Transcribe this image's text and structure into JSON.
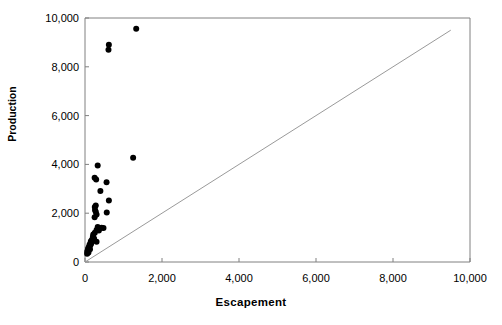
{
  "chart_data": {
    "type": "scatter",
    "title": "",
    "xlabel": "Escapement",
    "ylabel": "Production",
    "xlim": [
      0,
      10000
    ],
    "ylim": [
      0,
      10000
    ],
    "xticks": [
      0,
      2000,
      4000,
      6000,
      8000,
      10000
    ],
    "yticks": [
      0,
      2000,
      4000,
      6000,
      8000,
      10000
    ],
    "xtick_labels": [
      "0",
      "2,000",
      "4,000",
      "6,000",
      "8,000",
      "10,000"
    ],
    "ytick_labels": [
      "0",
      "2,000",
      "4,000",
      "6,000",
      "8,000",
      "10,000"
    ],
    "grid": false,
    "legend": false,
    "marker_color": "#000000",
    "marker_size": 6,
    "axis_color": "#808080",
    "reference_line": {
      "name": "replacement-line",
      "from": [
        0,
        0
      ],
      "to": [
        9500,
        9500
      ],
      "color": "#9a9a9a"
    },
    "series": [
      {
        "name": "Escapement vs Production",
        "points": [
          [
            1330,
            9560
          ],
          [
            620,
            8900
          ],
          [
            610,
            8700
          ],
          [
            330,
            3960
          ],
          [
            1250,
            4270
          ],
          [
            250,
            3450
          ],
          [
            290,
            3380
          ],
          [
            560,
            3270
          ],
          [
            400,
            2910
          ],
          [
            620,
            2520
          ],
          [
            280,
            2320
          ],
          [
            255,
            2250
          ],
          [
            260,
            2130
          ],
          [
            280,
            2060
          ],
          [
            565,
            2030
          ],
          [
            300,
            1950
          ],
          [
            250,
            1830
          ],
          [
            330,
            1430
          ],
          [
            430,
            1400
          ],
          [
            480,
            1390
          ],
          [
            300,
            1310
          ],
          [
            360,
            1290
          ],
          [
            255,
            1200
          ],
          [
            215,
            1130
          ],
          [
            205,
            1030
          ],
          [
            235,
            960
          ],
          [
            175,
            900
          ],
          [
            150,
            840
          ],
          [
            300,
            830
          ],
          [
            160,
            760
          ],
          [
            120,
            720
          ],
          [
            140,
            690
          ],
          [
            110,
            640
          ],
          [
            95,
            590
          ],
          [
            80,
            540
          ],
          [
            130,
            520
          ],
          [
            70,
            470
          ],
          [
            60,
            420
          ],
          [
            90,
            390
          ],
          [
            55,
            340
          ]
        ]
      }
    ]
  }
}
